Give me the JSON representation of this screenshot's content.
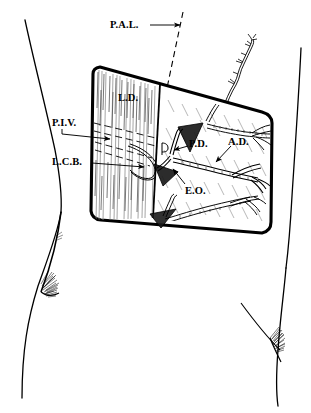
{
  "figure": {
    "style": {
      "ink": "#000000",
      "paper": "#ffffff",
      "hatch": "#8a8a8a",
      "dash": "#3a3a3a"
    }
  },
  "labels": [
    {
      "id": "pal",
      "text": "P.A.L.",
      "meaning": "posterior-axillary-line",
      "x": 110,
      "y": 20,
      "leader": {
        "type": "arrow",
        "x1": 150,
        "y1": 25,
        "x2": 182,
        "y2": 25
      }
    },
    {
      "id": "ld",
      "text": "L.D.",
      "meaning": "latissimus-dorsi",
      "x": 118,
      "y": 93,
      "leader": null
    },
    {
      "id": "piv",
      "text": "P.I.V.",
      "meaning": "posterior-intercostal-vessels",
      "x": 52,
      "y": 118,
      "leader": {
        "type": "arrow",
        "x1": 62,
        "y1": 132,
        "x2": 113,
        "y2": 140
      }
    },
    {
      "id": "lcb",
      "text": "L.C.B.",
      "meaning": "lateral-cutaneous-branch",
      "x": 52,
      "y": 157,
      "leader": {
        "type": "arrow",
        "x1": 92,
        "y1": 163,
        "x2": 147,
        "y2": 167
      }
    },
    {
      "id": "pd",
      "text": "P.D.",
      "meaning": "posterior-descending-branch",
      "x": 189,
      "y": 139,
      "leader": {
        "type": "arrow",
        "x1": 187,
        "y1": 146,
        "x2": 172,
        "y2": 151
      }
    },
    {
      "id": "ad",
      "text": "A.D.",
      "meaning": "anterior-descending-branch",
      "x": 228,
      "y": 137,
      "leader": {
        "type": "arrow",
        "x1": 229,
        "y1": 145,
        "x2": 213,
        "y2": 163
      }
    },
    {
      "id": "eo",
      "text": "E.O.",
      "meaning": "external-oblique",
      "x": 185,
      "y": 186,
      "leader": {
        "type": "arrow",
        "x1": 184,
        "y1": 183,
        "x2": 172,
        "y2": 167
      }
    }
  ],
  "legend_keys": {
    "P.A.L.": "Posterior axillary line",
    "L.D.": "Latissimus dorsi",
    "P.I.V.": "Posterior intercostal vessels",
    "L.C.B.": "Lateral cutaneous branch",
    "P.D.": "Posterior descending branch",
    "A.D.": "Anterior descending branch",
    "E.O.": "External oblique"
  }
}
